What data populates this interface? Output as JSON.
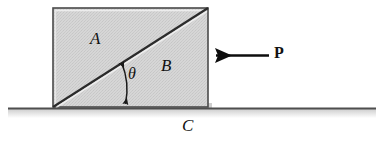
{
  "figure": {
    "type": "free-body-mechanics-diagram",
    "labels": {
      "wedge_upper_left": "A",
      "wedge_lower_right": "B",
      "ground_surface": "C",
      "applied_force": "P",
      "angle": "θ"
    },
    "colors": {
      "block_fill": "#d4d4d4",
      "outline": "#3a3a3a",
      "diagonal": "#2b2b2b",
      "ground_line": "#555555",
      "ground_shadow": "#c9c9c9",
      "arrow": "#0d0d0d",
      "text": "#111111",
      "background": "#ffffff"
    },
    "geometry": {
      "block_left_x": 53,
      "block_right_x": 208,
      "block_top_y": 8,
      "block_bottom_y": 107,
      "diagonal_from": "bottom-left",
      "diagonal_to": "top-right",
      "ground_line_y": 108,
      "ground_line_start_x": 8,
      "ground_line_end_x": 376,
      "force_arrow_y": 55,
      "force_arrow_tail_x": 269,
      "force_arrow_tip_x": 210,
      "force_arrow_direction": "left",
      "angle_arc_vertex_x": 53,
      "angle_arc_vertex_y": 107
    },
    "elements": {
      "wedge_a_name": "wedge-A",
      "wedge_b_name": "wedge-B",
      "ground_name": "ground-surface-C",
      "force_name": "force-P"
    }
  }
}
